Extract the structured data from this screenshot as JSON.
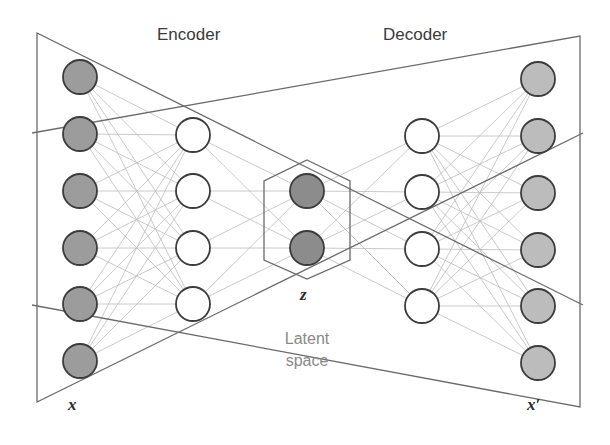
{
  "diagram": {
    "title_encoder": "Encoder",
    "title_decoder": "Decoder",
    "input_label": "x",
    "latent_label": "z",
    "output_label": "x′",
    "latent_caption_line1": "Latent",
    "latent_caption_line2": "space"
  },
  "colors": {
    "input_fill": "#9c9c9c",
    "hidden_fill": "#ffffff",
    "latent_fill": "#8c8c8c",
    "output_fill": "#bcbcbc",
    "node_stroke": "#3c3c3c",
    "edge": "#bdbdbd",
    "frame": "#6a6a6a"
  },
  "layers": [
    {
      "name": "input",
      "x": 80,
      "ys": [
        77,
        134,
        191,
        248,
        304,
        361
      ],
      "fill_key": "input_fill"
    },
    {
      "name": "encoder-hidden",
      "x": 193,
      "ys": [
        135,
        191,
        248,
        304
      ],
      "fill_key": "hidden_fill"
    },
    {
      "name": "latent",
      "x": 307,
      "ys": [
        191,
        248
      ],
      "fill_key": "latent_fill"
    },
    {
      "name": "decoder-hidden",
      "x": 422,
      "ys": [
        136,
        192,
        249,
        306
      ],
      "fill_key": "hidden_fill"
    },
    {
      "name": "output",
      "x": 538,
      "ys": [
        79,
        136,
        193,
        250,
        306,
        363
      ],
      "fill_key": "output_fill"
    }
  ],
  "node_radius": 17,
  "encoder_frame": [
    [
      37,
      33
    ],
    [
      37,
      402
    ],
    [
      583,
      133
    ]
  ],
  "decoder_frame": [
    [
      580,
      36
    ],
    [
      580,
      407
    ],
    [
      32,
      305
    ]
  ],
  "latent_hexagon": [
    [
      307,
      160
    ],
    [
      350,
      181
    ],
    [
      350,
      260
    ],
    [
      307,
      279
    ],
    [
      264,
      260
    ],
    [
      264,
      181
    ]
  ]
}
